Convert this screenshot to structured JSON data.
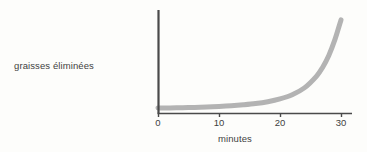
{
  "chart_data": {
    "type": "line",
    "title": "",
    "subtitle": "",
    "xlabel": "minutes",
    "ylabel": "graisses éliminées",
    "xlim": [
      0,
      32
    ],
    "ylim": [
      0,
      1
    ],
    "grid": false,
    "legend": null,
    "xticks": [
      {
        "value": 0,
        "label": "0",
        "px": 158
      },
      {
        "value": 10,
        "label": "10",
        "px": 219
      },
      {
        "value": 20,
        "label": "20",
        "px": 280
      },
      {
        "value": 30,
        "label": "30",
        "px": 341
      }
    ],
    "yticks": [],
    "series": [
      {
        "name": "graisses éliminées",
        "color": "#b3b3b3",
        "line_width_px": 5,
        "x": [
          0,
          2,
          4,
          6,
          8,
          10,
          12,
          14,
          16,
          18,
          20,
          22,
          24,
          26,
          27,
          28,
          29,
          30
        ],
        "y": [
          0.055,
          0.057,
          0.059,
          0.062,
          0.066,
          0.071,
          0.078,
          0.088,
          0.101,
          0.12,
          0.148,
          0.19,
          0.26,
          0.38,
          0.47,
          0.59,
          0.75,
          0.95
        ]
      }
    ],
    "axis_color": "#4a4a4a",
    "text_color": "#3f3f3f",
    "background": "#fdfdfb",
    "annotations": []
  },
  "labels": {
    "y_axis": "graisses éliminées",
    "x_axis": "minutes",
    "tick_0": "0",
    "tick_10": "10",
    "tick_20": "20",
    "tick_30": "30"
  }
}
